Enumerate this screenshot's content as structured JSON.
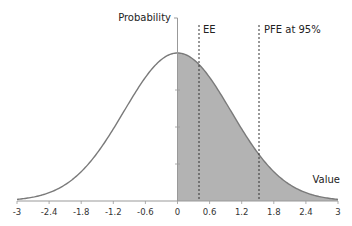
{
  "chart_data": {
    "type": "area",
    "title": "",
    "xlabel": "Value",
    "ylabel": "Probability",
    "xlim": [
      -3,
      3
    ],
    "x_ticks": [
      "-3",
      "-2.4",
      "-1.8",
      "-1.2",
      "-0.6",
      "0",
      "0.6",
      "1.2",
      "1.8",
      "2.4",
      "3"
    ],
    "grid": false,
    "legend": null,
    "series": [
      {
        "name": "Normal distribution (mean 0)",
        "curve": "standard normal density",
        "x_range": [
          -3,
          3
        ]
      },
      {
        "name": "Shaded positive exposure",
        "x_range": [
          0,
          3
        ],
        "fill": "#b3b3b3"
      }
    ],
    "annotations": [
      {
        "label": "EE",
        "x": 0.4,
        "style": "dashed vertical line"
      },
      {
        "label": "PFE at 95%",
        "x": 1.56,
        "style": "dashed vertical line"
      }
    ]
  },
  "labels": {
    "ylabel": "Probability",
    "xlabel": "Value",
    "ee": "EE",
    "pfe": "PFE at 95%"
  },
  "colors": {
    "curve": "#7a7a7a",
    "fill": "#b3b3b3",
    "axis": "#999999"
  }
}
